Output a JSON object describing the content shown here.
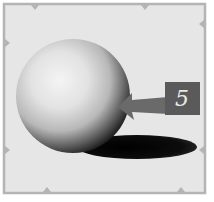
{
  "figure": {
    "label": "5",
    "callout": "arrow pointing to sphere's core shadow",
    "colors": {
      "background": "#e6e6e6",
      "frame": "#b4b4b4",
      "label_box": "#5a5a5a",
      "label_text": "#e8e8e8",
      "arrow": "#6a6a6a",
      "shadow": "#0c0c0c"
    }
  }
}
